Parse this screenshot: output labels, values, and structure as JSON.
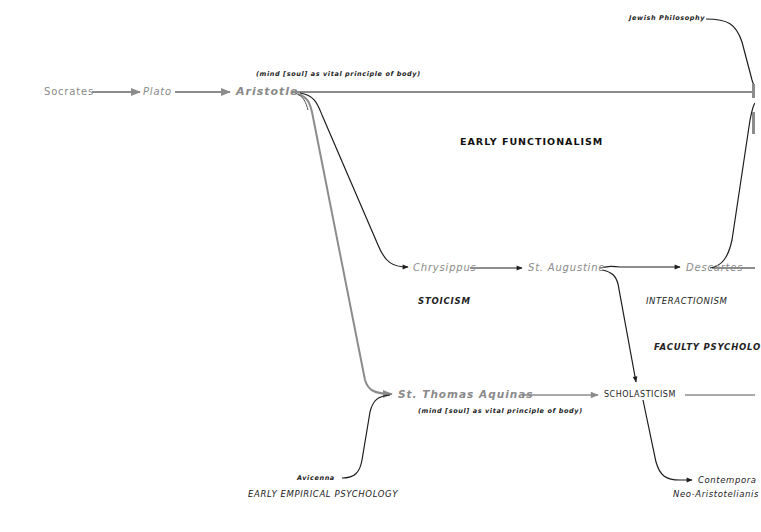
{
  "diagram": {
    "colors": {
      "grey_line": "#8c8c8c",
      "dark_line": "#1e1e1e",
      "grey_text": "#8a8a8a",
      "dark_text": "#111111",
      "background": "#ffffff"
    },
    "nodes": {
      "socrates": "Socrates",
      "plato": "Plato",
      "aristotle": "Aristotle",
      "aristotle_note": "(mind [soul] as vital principle of body)",
      "jewish_philosophy": "Jewish Philosophy",
      "chrysippus": "Chrysippus",
      "st_augustine": "St. Augustine",
      "descartes": "Descartes",
      "st_thomas_aquinas": "St. Thomas Aquinas",
      "aquinas_note": "(mind [soul] as vital principle of body)",
      "scholasticism": "SCHOLASTICISM",
      "avicenna": "Avicenna",
      "contemporary": "Contempora",
      "neo_aristotelianism": "Neo-Aristotelianis"
    },
    "schools": {
      "early_functionalism": "EARLY FUNCTIONALISM",
      "stoicism": "STOICISM",
      "interactionism": "INTERACTIONISM",
      "faculty_psychology": "FACULTY PSYCHOLO",
      "early_empirical_psychology": "EARLY EMPIRICAL PSYCHOLOGY"
    }
  }
}
